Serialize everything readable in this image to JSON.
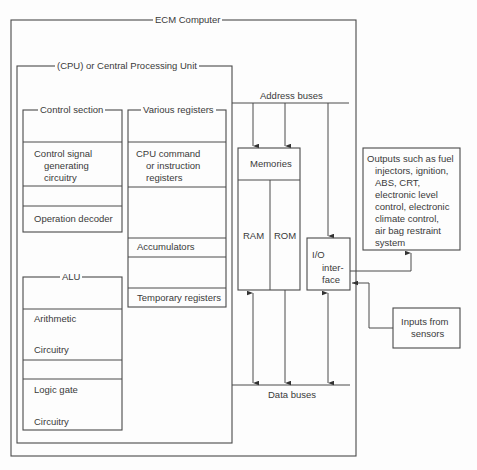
{
  "diagram": {
    "ecm_title": "ECM Computer",
    "cpu_title": "(CPU) or Central Processing Unit",
    "control_section": {
      "title": "Control section",
      "signal_line1": "Control signal",
      "signal_line2": "generating",
      "signal_line3": "circuitry",
      "decoder": "Operation decoder"
    },
    "registers": {
      "title": "Various registers",
      "cmd_line1": "CPU command",
      "cmd_line2": "or instruction",
      "cmd_line3": "registers",
      "accumulators": "Accumulators",
      "temporary": "Temporary registers"
    },
    "alu": {
      "title": "ALU",
      "arith1": "Arithmetic",
      "arith2": "Circuitry",
      "logic1": "Logic gate",
      "logic2": "Circuitry"
    },
    "address_buses": "Address buses",
    "data_buses": "Data buses",
    "memories": {
      "title": "Memories",
      "ram": "RAM",
      "rom": "ROM"
    },
    "io": {
      "line1": "I/O",
      "line2": "inter-",
      "line3": "face"
    },
    "outputs": {
      "line1": "Outputs such as fuel",
      "line2": "injectors, ignition,",
      "line3": "ABS, CRT,",
      "line4": "electronic level",
      "line5": "control, electronic",
      "line6": "climate control,",
      "line7": "air bag restraint",
      "line8": "system"
    },
    "inputs": {
      "line1": "Inputs from",
      "line2": "sensors"
    }
  }
}
